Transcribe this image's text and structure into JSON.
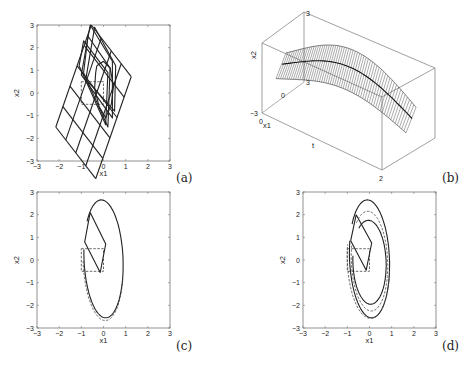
{
  "figure": {
    "panels": [
      "(a)",
      "(b)",
      "(c)",
      "(d)"
    ]
  },
  "chart_data": [
    {
      "panel": "(a)",
      "type": "line",
      "title": "",
      "xlabel": "x1",
      "ylabel": "x2",
      "xlim": [
        -3,
        3
      ],
      "ylim": [
        -3,
        3
      ],
      "xticks": [
        "-3",
        "-2",
        "-1",
        "0",
        "1",
        "2",
        "3"
      ],
      "yticks": [
        "3",
        "2",
        "1",
        "0",
        "-1",
        "-2",
        "-3"
      ],
      "grid": false,
      "series": [
        {
          "name": "initial box",
          "style": "dashed",
          "points": [
            [
              -1,
              0.5
            ],
            [
              0,
              0.5
            ],
            [
              0,
              -0.5
            ],
            [
              -1,
              -0.5
            ],
            [
              -1,
              0.5
            ]
          ]
        },
        {
          "name": "parallelogram family",
          "style": "solid",
          "shapes": [
            [
              [
                -0.7,
                2.5
              ],
              [
                0.3,
                1.1
              ],
              [
                0.2,
                -1.5
              ],
              [
                -0.9,
                0.9
              ]
            ],
            [
              [
                -0.6,
                3.0
              ],
              [
                0.4,
                1.4
              ],
              [
                0.4,
                -1.1
              ],
              [
                -1.0,
                0.8
              ]
            ],
            [
              [
                -0.4,
                2.9
              ],
              [
                0.55,
                1.2
              ],
              [
                0.5,
                -0.8
              ],
              [
                -0.8,
                0.6
              ]
            ],
            [
              [
                -0.9,
                2.3
              ],
              [
                0.2,
                0.9
              ],
              [
                0.1,
                -1.4
              ],
              [
                -1.1,
                1.2
              ]
            ]
          ]
        },
        {
          "name": "trajectory",
          "style": "solid",
          "points": [
            [
              -0.3,
              1.2
            ],
            [
              0.0,
              1.4
            ],
            [
              0.3,
              1.1
            ],
            [
              0.45,
              0.3
            ],
            [
              0.35,
              -0.5
            ],
            [
              0.1,
              -1.1
            ],
            [
              -0.2,
              -0.6
            ],
            [
              -0.4,
              0.2
            ],
            [
              -0.35,
              0.9
            ],
            [
              -0.3,
              1.2
            ]
          ]
        }
      ]
    },
    {
      "panel": "(b)",
      "type": "line",
      "title": "",
      "xlabel": "x1",
      "ylabel": "x2",
      "zlabel": "t",
      "view": "3d",
      "tick_labels": {
        "x2_top": "3",
        "x2_bottom": "-3",
        "x1_zero": "0",
        "x1_near": "0",
        "x1_far": "3",
        "t_end": "2"
      },
      "tlim": [
        0,
        2
      ],
      "x1lim": [
        -3,
        3
      ],
      "x2lim": [
        -3,
        3
      ],
      "series": [
        {
          "name": "tube of reachable sets",
          "style": "hatched"
        },
        {
          "name": "trajectory",
          "style": "solid"
        }
      ]
    },
    {
      "panel": "(c)",
      "type": "line",
      "title": "",
      "xlabel": "x1",
      "ylabel": "x2",
      "xlim": [
        -3,
        3
      ],
      "ylim": [
        -3,
        3
      ],
      "xticks": [
        "-3",
        "-2",
        "-1",
        "0",
        "1",
        "2",
        "3"
      ],
      "yticks": [
        "3",
        "2",
        "1",
        "0",
        "-1",
        "-2",
        "-3"
      ],
      "series": [
        {
          "name": "initial box",
          "style": "dashed",
          "points": [
            [
              -1,
              0.5
            ],
            [
              0,
              0.5
            ],
            [
              0,
              -0.5
            ],
            [
              -1,
              -0.5
            ],
            [
              -1,
              0.5
            ]
          ]
        },
        {
          "name": "final set",
          "style": "solid",
          "points": [
            [
              -0.6,
              2.1
            ],
            [
              -0.85,
              0.8
            ],
            [
              -0.15,
              -0.55
            ],
            [
              0.1,
              0.7
            ],
            [
              -0.6,
              2.1
            ]
          ]
        },
        {
          "name": "trajectory solid",
          "style": "solid"
        },
        {
          "name": "trajectory dashed",
          "style": "dashed"
        }
      ]
    },
    {
      "panel": "(d)",
      "type": "line",
      "title": "",
      "xlabel": "x1",
      "ylabel": "x2",
      "xlim": [
        -3,
        3
      ],
      "ylim": [
        -3,
        3
      ],
      "xticks": [
        "-3",
        "-2",
        "-1",
        "0",
        "1",
        "2",
        "3"
      ],
      "yticks": [
        "3",
        "2",
        "1",
        "0",
        "-1",
        "-2",
        "-3"
      ],
      "series": [
        {
          "name": "initial box",
          "style": "dashed",
          "points": [
            [
              -1,
              0.5
            ],
            [
              0,
              0.5
            ],
            [
              0,
              -0.5
            ],
            [
              -1,
              -0.5
            ],
            [
              -1,
              0.5
            ]
          ]
        },
        {
          "name": "final set",
          "style": "solid",
          "points": [
            [
              -0.6,
              2.0
            ],
            [
              -0.85,
              0.85
            ],
            [
              -0.15,
              -0.45
            ],
            [
              0.1,
              0.75
            ],
            [
              -0.6,
              2.0
            ]
          ]
        },
        {
          "name": "outer spiral solid",
          "style": "solid"
        },
        {
          "name": "inner spiral solid",
          "style": "solid"
        },
        {
          "name": "spiral dashed",
          "style": "dashed"
        }
      ]
    }
  ]
}
